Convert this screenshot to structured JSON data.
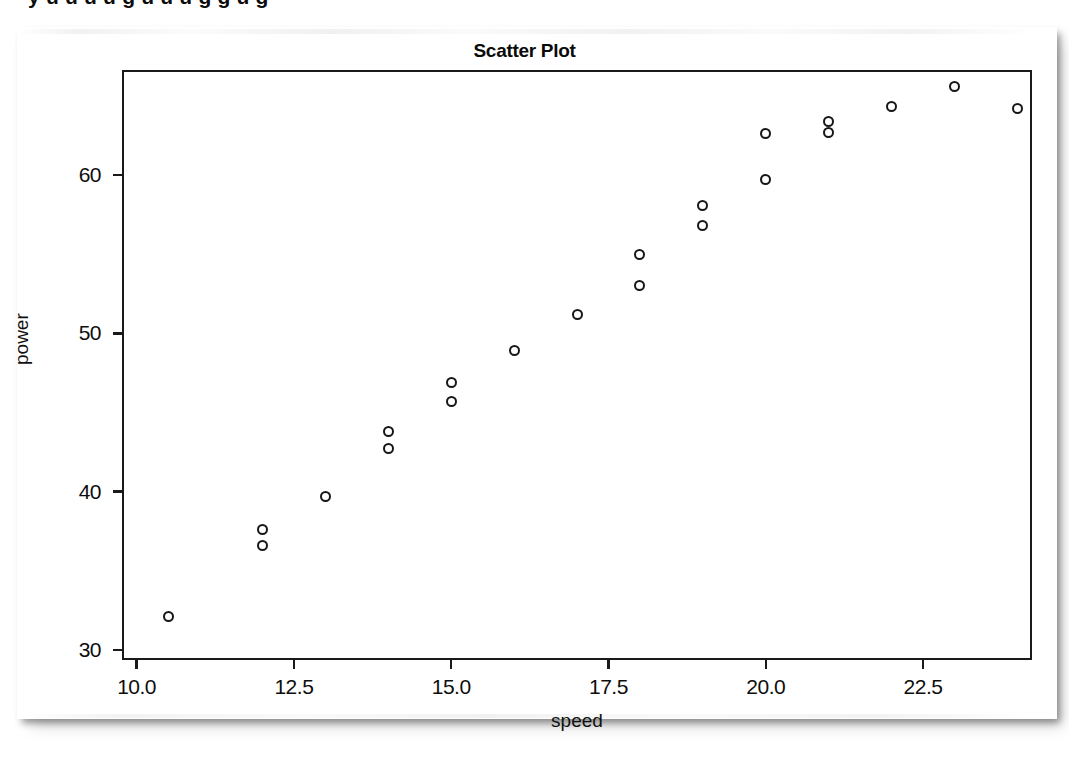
{
  "document": {
    "cropped_text_above_figure": "y    u   u  u     u  g   u   u u  g  g  u    g"
  },
  "figure": {
    "title": "Scatter Plot",
    "marker_symbol": "open-circle"
  },
  "chart_data": {
    "type": "scatter",
    "title": "Scatter Plot",
    "xlabel": "speed",
    "ylabel": "power",
    "xlim": [
      9.8,
      24.2
    ],
    "ylim": [
      29.5,
      66.5
    ],
    "xticks": [
      10.0,
      12.5,
      15.0,
      17.5,
      20.0,
      22.5
    ],
    "xtick_labels": [
      "10.0",
      "12.5",
      "15.0",
      "17.5",
      "20.0",
      "22.5"
    ],
    "yticks": [
      30,
      40,
      50,
      60
    ],
    "ytick_labels": [
      "30",
      "40",
      "50",
      "60"
    ],
    "grid": false,
    "legend": null,
    "n_points": 22,
    "x": [
      10.5,
      12.0,
      12.0,
      13.0,
      14.0,
      14.0,
      15.0,
      15.0,
      16.0,
      17.0,
      18.0,
      18.0,
      19.0,
      19.0,
      20.0,
      20.0,
      21.0,
      21.0,
      22.0,
      23.0,
      24.0
    ],
    "y": [
      32.1,
      37.6,
      36.6,
      39.7,
      43.8,
      42.7,
      46.9,
      45.7,
      48.9,
      51.2,
      55.0,
      53.0,
      58.1,
      56.8,
      62.6,
      59.7,
      63.4,
      62.7,
      64.3,
      65.6,
      64.2
    ],
    "points": [
      {
        "x": 10.5,
        "y": 32.1
      },
      {
        "x": 12.0,
        "y": 37.6
      },
      {
        "x": 12.0,
        "y": 36.6
      },
      {
        "x": 13.0,
        "y": 39.7
      },
      {
        "x": 14.0,
        "y": 43.8
      },
      {
        "x": 14.0,
        "y": 42.7
      },
      {
        "x": 15.0,
        "y": 46.9
      },
      {
        "x": 15.0,
        "y": 45.7
      },
      {
        "x": 16.0,
        "y": 48.9
      },
      {
        "x": 17.0,
        "y": 51.2
      },
      {
        "x": 18.0,
        "y": 55.0
      },
      {
        "x": 18.0,
        "y": 53.0
      },
      {
        "x": 19.0,
        "y": 58.1
      },
      {
        "x": 19.0,
        "y": 56.8
      },
      {
        "x": 20.0,
        "y": 62.6
      },
      {
        "x": 20.0,
        "y": 59.7
      },
      {
        "x": 21.0,
        "y": 63.4
      },
      {
        "x": 21.0,
        "y": 62.7
      },
      {
        "x": 22.0,
        "y": 64.3
      },
      {
        "x": 23.0,
        "y": 65.6
      },
      {
        "x": 24.0,
        "y": 64.2
      }
    ]
  }
}
